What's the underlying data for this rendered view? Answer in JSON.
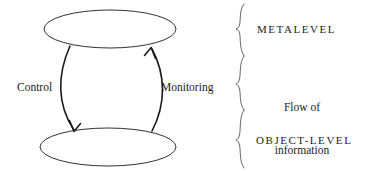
{
  "figure": {
    "name": "metalevel-object-level-monitoring-control-diagram",
    "background_color": "#ffffff",
    "stroke_color": "#1a1a1a"
  },
  "nodes": [
    {
      "id": "metalevel-ellipse",
      "label": "",
      "shape": "ellipse"
    },
    {
      "id": "object-level-ellipse",
      "label": "",
      "shape": "ellipse"
    }
  ],
  "arrows": {
    "control": {
      "label": "Control",
      "direction": "metalevel-to-object-level",
      "side": "left"
    },
    "monitoring": {
      "label": "Monitoring",
      "direction": "object-level-to-metalevel",
      "side": "right"
    }
  },
  "levels": {
    "metalevel": "METALEVEL",
    "object_level": "OBJECT-LEVEL"
  },
  "flow": {
    "line1": "Flow of",
    "line2": "information"
  },
  "braces": {
    "count": 3,
    "orientation": "right-pointing",
    "targets": [
      "METALEVEL",
      "Flow of information",
      "OBJECT-LEVEL"
    ]
  }
}
